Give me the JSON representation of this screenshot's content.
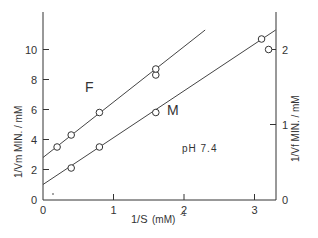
{
  "chart_data": {
    "type": "scatter",
    "title": "",
    "xlabel": "1/S (mM)^-1",
    "ylabel_left": "1/Vm MIN. / mM",
    "ylabel_right": "1/Vf MIN. / mM",
    "annotation": "pH 7.4",
    "xlim": [
      0,
      3.3
    ],
    "ylim_left": [
      0,
      12.5
    ],
    "ylim_right": [
      0,
      2.5
    ],
    "x_ticks": [
      "0",
      "1",
      "2",
      "3"
    ],
    "y_ticks_left": [
      "0",
      "2",
      "4",
      "6",
      "8",
      "10"
    ],
    "y_ticks_right": [
      "0",
      "1",
      "2"
    ],
    "grid": false,
    "series": [
      {
        "name": "F",
        "axis": "left",
        "points": [
          [
            0.2,
            3.5
          ],
          [
            0.4,
            4.3
          ],
          [
            0.8,
            5.8
          ],
          [
            1.6,
            8.3
          ],
          [
            1.6,
            8.7
          ]
        ],
        "fit_line": {
          "x": [
            0,
            2.3
          ],
          "y": [
            2.8,
            11.3
          ]
        }
      },
      {
        "name": "M",
        "axis": "left",
        "points": [
          [
            0.4,
            2.1
          ],
          [
            0.8,
            3.5
          ],
          [
            1.6,
            5.8
          ],
          [
            3.1,
            10.7
          ],
          [
            3.2,
            10.0
          ]
        ],
        "fit_line": {
          "x": [
            0,
            3.3
          ],
          "y": [
            1.0,
            11.3
          ]
        }
      }
    ]
  },
  "labels": {
    "series_f": "F",
    "series_m": "M",
    "ph": "pH 7.4",
    "xlabel_main": "1/S",
    "xlabel_unit": "(mM)",
    "xlabel_exp": "-1",
    "ylabel_left": "1/Vm MIN. / mM",
    "ylabel_right": "1/Vf MIN. / mM"
  }
}
